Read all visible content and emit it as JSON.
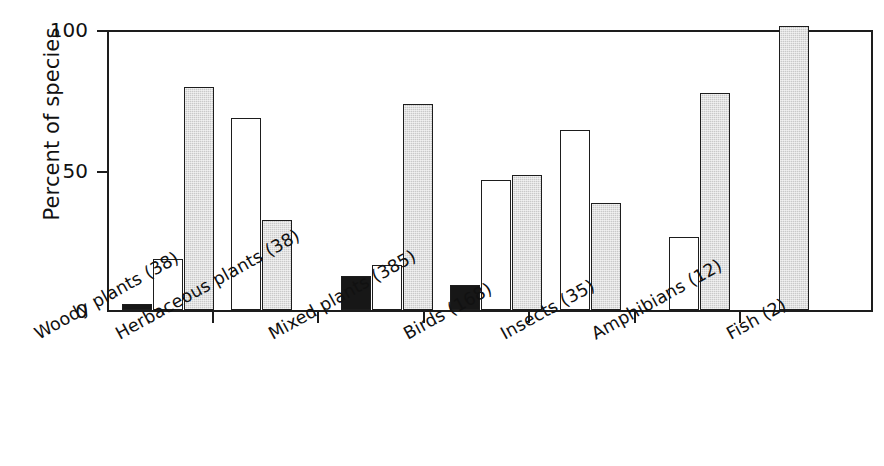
{
  "chart_data": {
    "type": "bar",
    "title": "",
    "xlabel": "",
    "ylabel": "Percent of species",
    "ylim": [
      0,
      100
    ],
    "yticks": [
      0,
      50,
      100
    ],
    "ytick_labels": [
      "0",
      "50",
      "100"
    ],
    "grid": false,
    "legend": "none",
    "categories": [
      "Woody plants (38)",
      "Herbaceous plants (38)",
      "Mixed plants (385)",
      "Birds (168)",
      "Insects (35)",
      "Amphibians (12)",
      "Fish (2)"
    ],
    "series": [
      {
        "name": "black",
        "fill": "#171717",
        "values": [
          2,
          0,
          12,
          9,
          0,
          0,
          0
        ]
      },
      {
        "name": "white",
        "fill": "#ffffff",
        "values": [
          18,
          68,
          16,
          46,
          64,
          26,
          0
        ]
      },
      {
        "name": "gray",
        "fill": "#c9c9c9",
        "values": [
          79,
          32,
          73,
          48,
          38,
          77,
          100
        ]
      }
    ]
  },
  "axis": {
    "y_title": "Percent of species",
    "tick_100": "100",
    "tick_50": "50",
    "tick_0": "0"
  },
  "labels": {
    "cat0": "Woody plants (38)",
    "cat1": "Herbaceous plants (38)",
    "cat2": "Mixed plants (385)",
    "cat3": "Birds (168)",
    "cat4": "Insects (35)",
    "cat5": "Amphibians (12)",
    "cat6": "Fish (2)"
  }
}
